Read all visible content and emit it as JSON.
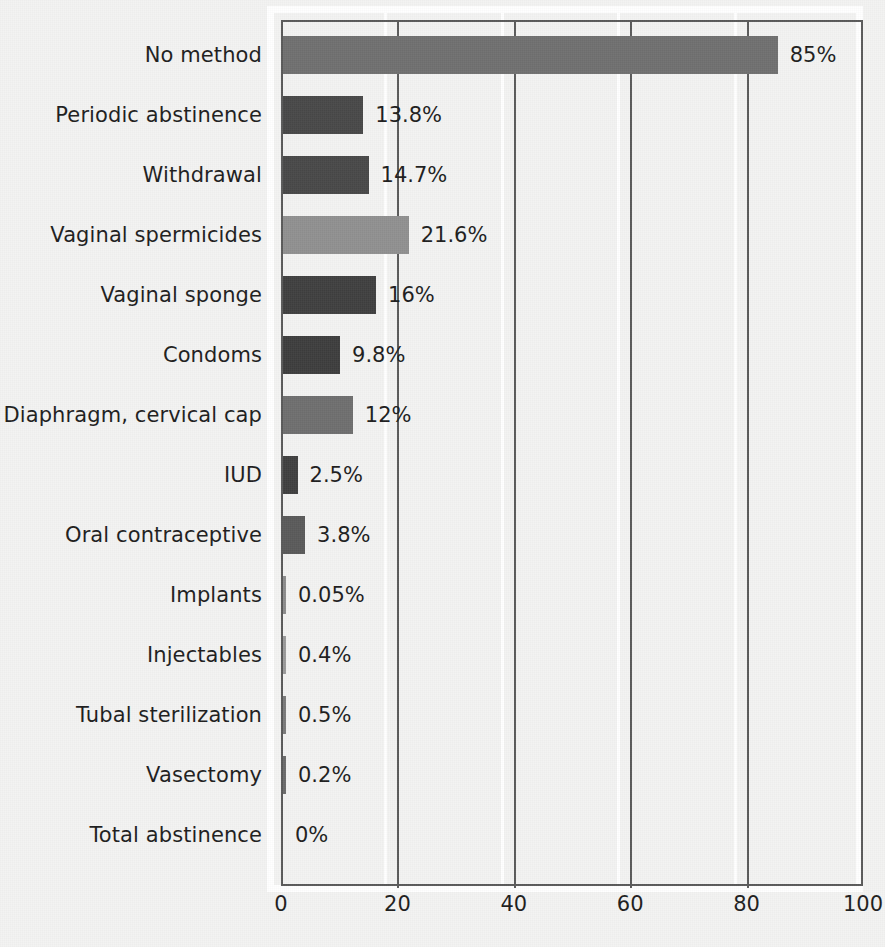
{
  "chart_data": {
    "type": "bar",
    "orientation": "horizontal",
    "title": "",
    "subtitle": "",
    "xlabel": "",
    "ylabel": "",
    "xlim": [
      0,
      100
    ],
    "xticks": [
      0,
      20,
      40,
      60,
      80,
      100
    ],
    "xtick_labels": [
      "0",
      "20",
      "40",
      "60",
      "80",
      "100"
    ],
    "grid": "vertical",
    "legend": "none",
    "unit": "%",
    "categories": [
      "No method",
      "Periodic abstinence",
      "Withdrawal",
      "Vaginal spermicides",
      "Vaginal sponge",
      "Condoms",
      "Diaphragm, cervical cap",
      "IUD",
      "Oral contraceptive",
      "Implants",
      "Injectables",
      "Tubal sterilization",
      "Vasectomy",
      "Total abstinence"
    ],
    "values": [
      85,
      13.8,
      14.7,
      21.6,
      16,
      9.8,
      12,
      2.5,
      3.8,
      0.05,
      0.4,
      0.5,
      0.2,
      0
    ],
    "value_labels": [
      "85%",
      "13.8%",
      "14.7%",
      "21.6%",
      "16%",
      "9.8%",
      "12%",
      "2.5%",
      "3.8%",
      "0.05%",
      "0.4%",
      "0.5%",
      "0.2%",
      "0%"
    ],
    "bar_colors": [
      "#6f6f6f",
      "#484848",
      "#484848",
      "#909090",
      "#3f3f3f",
      "#3d3d3d",
      "#6e6e6e",
      "#3f3f3f",
      "#5a5a5a",
      "#8c8c8c",
      "#9a9a9a",
      "#7a7a7a",
      "#6a6a6a",
      "#6a6a6a"
    ]
  },
  "colors": {
    "background": "#f3f3f2",
    "axis": "#5a5a5a",
    "gridline": "#5a5a5a",
    "gridline_halo": "#ffffff",
    "text": "#1d1d1d",
    "frame": "#ffffff"
  }
}
